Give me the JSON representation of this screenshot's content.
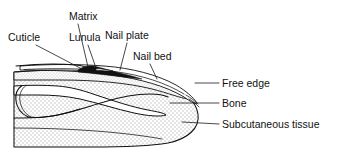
{
  "figure": {
    "type": "anatomical-diagram",
    "width": 337,
    "height": 164,
    "background_color": "#ffffff",
    "line_color": "#111111"
  },
  "labels": {
    "matrix": "Matrix",
    "cuticle": "Cuticle",
    "lunula": "Lunula",
    "nail_plate": "Nail plate",
    "nail_bed": "Nail bed",
    "free_edge": "Free edge",
    "bone": "Bone",
    "subcutaneous_tissue": "Subcutaneous tissue"
  },
  "structures": [
    {
      "name": "matrix",
      "label": "Matrix",
      "description": "Dark wedge at nail root where nail growth originates",
      "fill": "#121212",
      "label_position": {
        "x": 69,
        "y": 20
      },
      "anchor_point": {
        "x": 88,
        "y": 69
      }
    },
    {
      "name": "cuticle",
      "label": "Cuticle",
      "description": "Fold of skin overlapping the nail root",
      "fill": "#ffffff",
      "label_position": {
        "x": 8,
        "y": 41
      },
      "anchor_point": {
        "x": 82,
        "y": 70
      }
    },
    {
      "name": "lunula",
      "label": "Lunula",
      "description": "Pale crescent at base of nail plate",
      "fill": "#ffffff",
      "label_position": {
        "x": 69,
        "y": 41
      },
      "anchor_point": {
        "x": 95,
        "y": 70
      }
    },
    {
      "name": "nail-plate",
      "label": "Nail plate",
      "description": "Hard keratin plate covering the nail bed",
      "fill": "#ffffff",
      "label_position": {
        "x": 105,
        "y": 39
      },
      "anchor_point": {
        "x": 122,
        "y": 72
      }
    },
    {
      "name": "nail-bed",
      "label": "Nail bed",
      "description": "Stippled tissue layer beneath the nail plate",
      "fill": "stipple",
      "label_position": {
        "x": 133,
        "y": 60
      },
      "anchor_point": {
        "x": 155,
        "y": 78
      }
    },
    {
      "name": "free-edge",
      "label": "Free edge",
      "description": "Distal end of the nail plate extending past the fingertip",
      "fill": "#ffffff",
      "label_position": {
        "x": 222,
        "y": 87
      },
      "anchor_point": {
        "x": 196,
        "y": 84
      }
    },
    {
      "name": "bone",
      "label": "Bone",
      "description": "Distal phalanx, unshaded white outline",
      "fill": "#ffffff",
      "label_position": {
        "x": 222,
        "y": 107
      },
      "anchor_point": {
        "x": 168,
        "y": 105
      }
    },
    {
      "name": "subcutaneous-tissue",
      "label": "Subcutaneous tissue",
      "description": "Stippled soft tissue of the fingertip pulp",
      "fill": "stipple",
      "label_position": {
        "x": 222,
        "y": 128
      },
      "anchor_point": {
        "x": 180,
        "y": 124
      }
    }
  ]
}
